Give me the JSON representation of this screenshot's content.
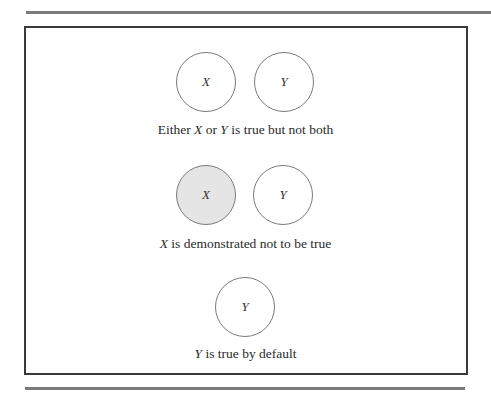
{
  "diagram": {
    "panels": [
      {
        "circles": [
          {
            "label": "X",
            "shaded": false
          },
          {
            "label": "Y",
            "shaded": false
          }
        ],
        "caption": {
          "parts": [
            {
              "text": "Either ",
              "italic": false
            },
            {
              "text": "X",
              "italic": true
            },
            {
              "text": " or ",
              "italic": false
            },
            {
              "text": "Y",
              "italic": true
            },
            {
              "text": " is true but not both",
              "italic": false
            }
          ],
          "full": "Either X or Y is true but not both"
        }
      },
      {
        "circles": [
          {
            "label": "X",
            "shaded": true
          },
          {
            "label": "Y",
            "shaded": false
          }
        ],
        "caption": {
          "parts": [
            {
              "text": "X",
              "italic": true
            },
            {
              "text": " is demonstrated not to be true",
              "italic": false
            }
          ],
          "full": "X is demonstrated not to be true"
        }
      },
      {
        "circles": [
          {
            "label": "Y",
            "shaded": false
          }
        ],
        "caption": {
          "parts": [
            {
              "text": "Y",
              "italic": true
            },
            {
              "text": " is true by default",
              "italic": false
            }
          ],
          "full": "Y is true by default"
        }
      }
    ],
    "colors": {
      "circle_stroke": "#7a7a7a",
      "shaded_fill": "#e5e5e5",
      "frame_border": "#3a3a3a",
      "rule": "#7a7a7a"
    }
  }
}
